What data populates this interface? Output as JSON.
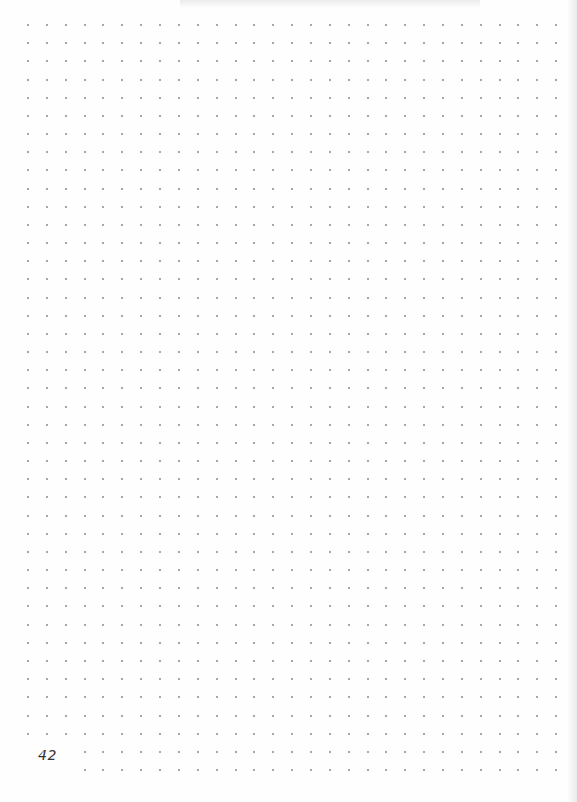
{
  "page": {
    "type": "dot-grid notebook page",
    "page_number": "42",
    "grid": {
      "columns": 29,
      "rows": 42,
      "origin_x": 28,
      "origin_y": 25,
      "spacing_x": 18.86,
      "spacing_y": 18.17,
      "dot_color": "#8a8a8a",
      "omitted_region": {
        "col_start": 0,
        "col_end": 2,
        "row_start": 40,
        "row_end": 41
      }
    },
    "colors": {
      "paper": "#fefefe",
      "ink": "#333333"
    }
  }
}
